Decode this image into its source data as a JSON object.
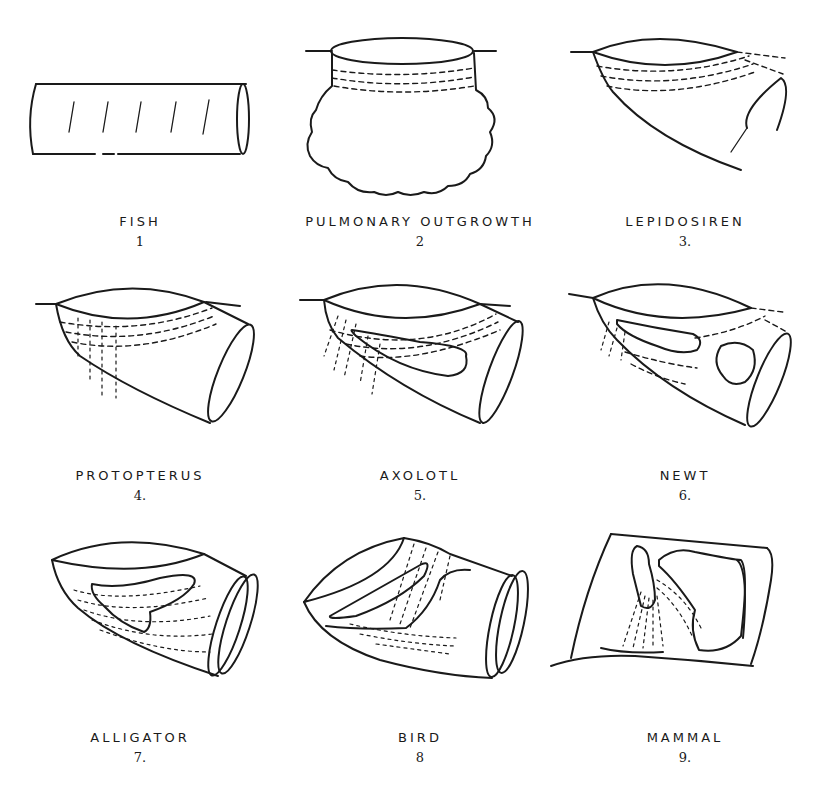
{
  "figure": {
    "panels": [
      {
        "id": 1,
        "label": "FISH",
        "number": "1"
      },
      {
        "id": 2,
        "label": "PULMONARY OUTGROWTH",
        "number": "2"
      },
      {
        "id": 3,
        "label": "LEPIDOSIREN",
        "number": "3."
      },
      {
        "id": 4,
        "label": "PROTOPTERUS",
        "number": "4."
      },
      {
        "id": 5,
        "label": "AXOLOTL",
        "number": "5."
      },
      {
        "id": 6,
        "label": "NEWT",
        "number": "6."
      },
      {
        "id": 7,
        "label": "ALLIGATOR",
        "number": "7."
      },
      {
        "id": 8,
        "label": "BIRD",
        "number": "8"
      },
      {
        "id": 9,
        "label": "MAMMAL",
        "number": "9."
      }
    ]
  },
  "colors": {
    "ink": "#1a1a1a",
    "background": "#ffffff"
  }
}
